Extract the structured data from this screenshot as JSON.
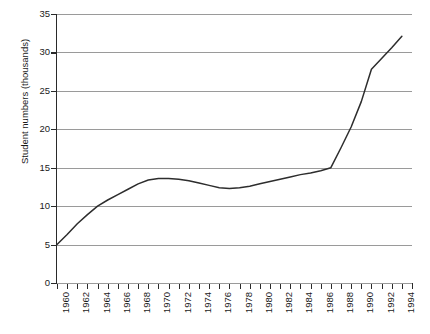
{
  "figure": {
    "top_clipped_caption": "",
    "background_color": "#ffffff",
    "line_color": "#2d2d2d",
    "grid_color": "#9a9a9a",
    "axis_color": "#2a2a2a"
  },
  "chart_data": {
    "type": "line",
    "title": "",
    "xlabel": "",
    "ylabel": "Student numbers (thousands)",
    "xlim": [
      1960,
      1995
    ],
    "ylim": [
      0,
      35
    ],
    "ytick_values": [
      0,
      5,
      10,
      15,
      20,
      25,
      30,
      35
    ],
    "ytick_labels": [
      "0",
      "5",
      "10",
      "15",
      "20",
      "25",
      "30",
      "35"
    ],
    "xtick_values": [
      1960,
      1961,
      1962,
      1963,
      1964,
      1965,
      1966,
      1967,
      1968,
      1969,
      1970,
      1971,
      1972,
      1973,
      1974,
      1975,
      1976,
      1977,
      1978,
      1979,
      1980,
      1981,
      1982,
      1983,
      1984,
      1985,
      1986,
      1987,
      1988,
      1989,
      1990,
      1991,
      1992,
      1993,
      1994,
      1995
    ],
    "xtick_labels": [
      "1960",
      "1962",
      "1964",
      "1966",
      "1968",
      "1970",
      "1972",
      "1974",
      "1976",
      "1978",
      "1980",
      "1982",
      "1984",
      "1986",
      "1988",
      "1990",
      "1992",
      "1994"
    ],
    "xtick_label_values": [
      1960,
      1962,
      1964,
      1966,
      1968,
      1970,
      1972,
      1974,
      1976,
      1978,
      1980,
      1982,
      1984,
      1986,
      1988,
      1990,
      1992,
      1994
    ],
    "grid": true,
    "grid_axis": "y",
    "legend": false,
    "legend_position": "none",
    "x": [
      1960,
      1961,
      1962,
      1963,
      1964,
      1965,
      1966,
      1967,
      1968,
      1969,
      1970,
      1971,
      1972,
      1973,
      1974,
      1975,
      1976,
      1977,
      1978,
      1979,
      1980,
      1981,
      1982,
      1983,
      1984,
      1985,
      1986,
      1987,
      1988,
      1989,
      1990,
      1991,
      1992,
      1993,
      1994
    ],
    "values": [
      5.0,
      6.3,
      7.7,
      8.9,
      10.0,
      10.8,
      11.5,
      12.2,
      12.9,
      13.4,
      13.6,
      13.6,
      13.5,
      13.3,
      13.0,
      12.7,
      12.4,
      12.3,
      12.4,
      12.6,
      12.9,
      13.2,
      13.5,
      13.8,
      14.1,
      14.3,
      14.6,
      15.0,
      17.6,
      20.3,
      23.6,
      27.8,
      29.2,
      30.6,
      32.1
    ],
    "series": [
      {
        "name": "Student numbers",
        "values": [
          5.0,
          6.3,
          7.7,
          8.9,
          10.0,
          10.8,
          11.5,
          12.2,
          12.9,
          13.4,
          13.6,
          13.6,
          13.5,
          13.3,
          13.0,
          12.7,
          12.4,
          12.3,
          12.4,
          12.6,
          12.9,
          13.2,
          13.5,
          13.8,
          14.1,
          14.3,
          14.6,
          15.0,
          17.6,
          20.3,
          23.6,
          27.8,
          29.2,
          30.6,
          32.1
        ],
        "color": "#2d2d2d"
      }
    ],
    "annotations": []
  }
}
